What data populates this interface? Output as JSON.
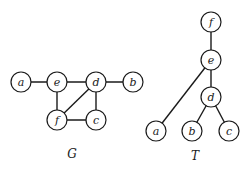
{
  "graphs": [
    {
      "id": "G",
      "caption": "G",
      "caption_pos": [
        72,
        158
      ],
      "nodes": [
        {
          "id": "a",
          "label": "a",
          "x": 21,
          "y": 82
        },
        {
          "id": "e",
          "label": "e",
          "x": 57,
          "y": 82
        },
        {
          "id": "d",
          "label": "d",
          "x": 96,
          "y": 82
        },
        {
          "id": "b",
          "label": "b",
          "x": 133,
          "y": 82
        },
        {
          "id": "f",
          "label": "f",
          "x": 57,
          "y": 120
        },
        {
          "id": "c",
          "label": "c",
          "x": 96,
          "y": 120
        }
      ],
      "edges": [
        [
          "a",
          "e"
        ],
        [
          "e",
          "d"
        ],
        [
          "d",
          "b"
        ],
        [
          "e",
          "f"
        ],
        [
          "f",
          "d"
        ],
        [
          "d",
          "c"
        ],
        [
          "f",
          "c"
        ]
      ]
    },
    {
      "id": "T",
      "caption": "T",
      "caption_pos": [
        195,
        160
      ],
      "nodes": [
        {
          "id": "f",
          "label": "f",
          "x": 211,
          "y": 22
        },
        {
          "id": "e",
          "label": "e",
          "x": 211,
          "y": 60
        },
        {
          "id": "d",
          "label": "d",
          "x": 211,
          "y": 97
        },
        {
          "id": "a",
          "label": "a",
          "x": 156,
          "y": 131
        },
        {
          "id": "b",
          "label": "b",
          "x": 192,
          "y": 131
        },
        {
          "id": "c",
          "label": "c",
          "x": 229,
          "y": 131
        }
      ],
      "edges": [
        [
          "f",
          "e"
        ],
        [
          "e",
          "a"
        ],
        [
          "e",
          "d"
        ],
        [
          "d",
          "b"
        ],
        [
          "d",
          "c"
        ]
      ]
    }
  ],
  "node_radius": 10
}
